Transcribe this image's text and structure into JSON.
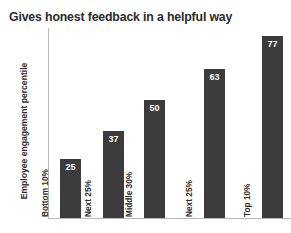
{
  "chart_data": {
    "type": "bar",
    "title": "Gives honest feedback in a helpful way",
    "xlabel": "",
    "ylabel": "Employee engagement percentile",
    "categories": [
      "Bottom 10%",
      "Next 25%",
      "Middle 30%",
      "Next 25%",
      "Top 10%"
    ],
    "values": [
      25,
      37,
      50,
      63,
      77
    ],
    "value_labels": [
      "25",
      "37",
      "50",
      "63",
      "77"
    ],
    "ylim": [
      0,
      81
    ],
    "grid": false,
    "legend": null,
    "bar_color": "#3c3c3c",
    "axis_color": "#b9b9b9",
    "text_color": "#2b2b2b",
    "value_label_color": "#ffffff"
  }
}
